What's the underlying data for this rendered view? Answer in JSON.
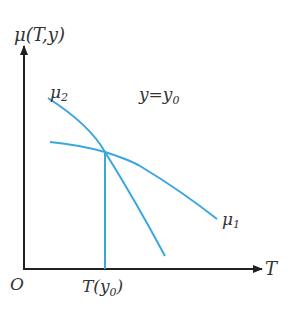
{
  "diagram": {
    "y_axis_label": "μ(T,y)",
    "x_axis_label": "T",
    "origin_label": "O",
    "condition_label": "y=y",
    "condition_sub": "0",
    "curve2_label": "μ",
    "curve2_sub": "2",
    "curve1_label": "μ",
    "curve1_sub": "1",
    "tick_label": "T(y",
    "tick_sub": "0",
    "tick_close": ")",
    "colors": {
      "curve": "#3aa6e0",
      "axis": "#222222",
      "text": "#333333"
    }
  }
}
